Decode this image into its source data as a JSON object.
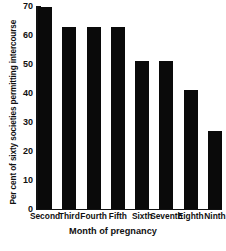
{
  "chart_data": {
    "type": "bar",
    "title": "",
    "xlabel": "Month of pregnancy",
    "ylabel": "Per cent of sixty societies permitting intercourse",
    "categories": [
      "Second",
      "Third",
      "Fourth",
      "Fifth",
      "Sixth",
      "Seventh",
      "Eighth",
      "Ninth"
    ],
    "values": [
      70,
      63,
      63,
      63,
      51,
      51,
      41,
      27
    ],
    "ylim": [
      0,
      70
    ],
    "yticks": [
      0,
      10,
      20,
      30,
      40,
      50,
      60,
      70
    ],
    "ytick_labels": [
      "0",
      "10",
      "20",
      "30",
      "40",
      "50",
      "60",
      "70"
    ],
    "grid": false,
    "legend": null,
    "bar_color": "#0a0a0a"
  }
}
